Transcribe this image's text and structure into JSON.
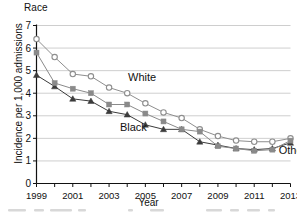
{
  "chart_data": {
    "type": "line",
    "title": "Race",
    "xlabel": "Year",
    "ylabel": "Incidence per 1,000 admissions",
    "xlim": [
      1999,
      2013
    ],
    "ylim": [
      0,
      7
    ],
    "grid": true,
    "legend_position": "inline-annotations",
    "x": [
      1999,
      2000,
      2001,
      2002,
      2003,
      2004,
      2005,
      2006,
      2007,
      2008,
      2009,
      2010,
      2011,
      2012,
      2013
    ],
    "xtick_labels": [
      "1999",
      "2001",
      "2003",
      "2005",
      "2007",
      "2009",
      "2011",
      "2013"
    ],
    "xtick_values": [
      1999,
      2001,
      2003,
      2005,
      2007,
      2009,
      2011,
      2013
    ],
    "ytick_labels": [
      "0",
      "1",
      "2",
      "3",
      "4",
      "5",
      "6",
      "7"
    ],
    "ytick_values": [
      0,
      1,
      2,
      3,
      4,
      5,
      6,
      7
    ],
    "series": [
      {
        "name": "White",
        "marker": "open-circle",
        "color": "#8e8e8e",
        "label_x": 2004.05,
        "label_y": 4.55,
        "values": [
          6.4,
          5.6,
          4.85,
          4.75,
          4.25,
          4.0,
          3.55,
          3.15,
          2.9,
          2.4,
          2.1,
          1.9,
          1.85,
          1.85,
          2.0
        ]
      },
      {
        "name": "Black",
        "marker": "filled-triangle",
        "color": "#3b3b3b",
        "label_x": 2003.6,
        "label_y": 2.32,
        "values": [
          4.8,
          4.3,
          3.75,
          3.65,
          3.2,
          3.05,
          2.6,
          2.4,
          2.4,
          1.85,
          1.7,
          1.55,
          1.5,
          1.55,
          1.8
        ]
      },
      {
        "name": "Other",
        "marker": "filled-square",
        "color": "#8a8a8a",
        "label_x": 2012.35,
        "label_y": 1.32,
        "values": [
          5.8,
          4.45,
          4.2,
          4.0,
          3.5,
          3.5,
          3.1,
          2.75,
          2.4,
          2.3,
          1.65,
          1.55,
          1.45,
          1.5,
          1.9
        ]
      }
    ]
  }
}
